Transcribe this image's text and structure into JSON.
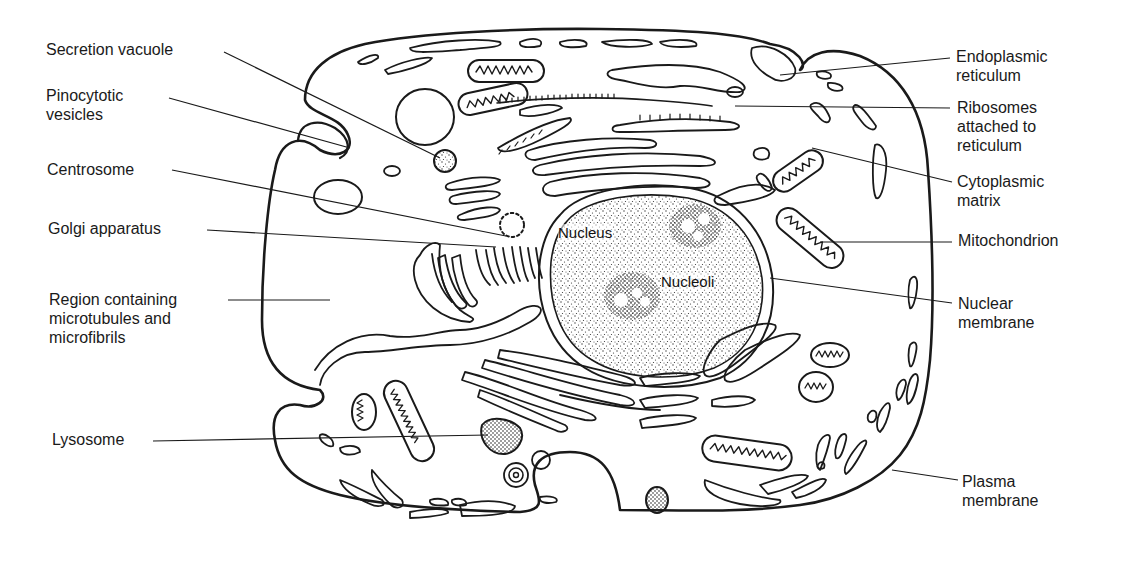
{
  "diagram": {
    "left_labels": [
      {
        "id": "secretion-vacuole",
        "lines": [
          "Secretion vacuole"
        ]
      },
      {
        "id": "pinocytotic-vesicles",
        "lines": [
          "Pinocytotic",
          "vesicles"
        ]
      },
      {
        "id": "centrosome",
        "lines": [
          "Centrosome"
        ]
      },
      {
        "id": "golgi-apparatus",
        "lines": [
          "Golgi apparatus"
        ]
      },
      {
        "id": "region-microtubules",
        "lines": [
          "Region containing",
          "microtubules  and",
          "microfibrils"
        ]
      },
      {
        "id": "lysosome",
        "lines": [
          "Lysosome"
        ]
      }
    ],
    "right_labels": [
      {
        "id": "endoplasmic-reticulum",
        "lines": [
          "Endoplasmic",
          "reticulum"
        ]
      },
      {
        "id": "ribosomes",
        "lines": [
          "Ribosomes",
          "attached to",
          "reticulum"
        ]
      },
      {
        "id": "cytoplasmic-matrix",
        "lines": [
          "Cytoplasmic",
          "matrix"
        ]
      },
      {
        "id": "mitochondrion",
        "lines": [
          "Mitochondrion"
        ]
      },
      {
        "id": "nuclear-membrane",
        "lines": [
          "Nuclear",
          "membrane"
        ]
      },
      {
        "id": "plasma-membrane",
        "lines": [
          "Plasma",
          "membrane"
        ]
      }
    ],
    "inner_labels": {
      "nucleus": "Nucleus",
      "nucleoli": "Nucleoli"
    },
    "colors": {
      "ink": "#1a1a1a",
      "background": "#ffffff",
      "stipple": "#333333"
    }
  }
}
